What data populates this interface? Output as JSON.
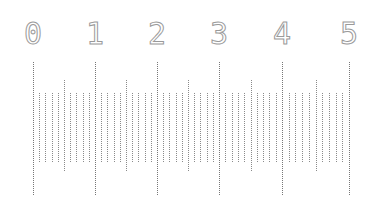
{
  "ruler": {
    "labels": [
      "0",
      "1",
      "2",
      "3",
      "4",
      "5"
    ],
    "major_x": [
      33,
      95,
      157,
      219,
      282,
      349
    ],
    "subdivisions": 10,
    "tick_color": "#8a8a8a",
    "label_color": "#9a9a9a",
    "major_span": [
      62,
      195
    ],
    "half_span": [
      80,
      172
    ],
    "minor_span": [
      93,
      162
    ]
  }
}
